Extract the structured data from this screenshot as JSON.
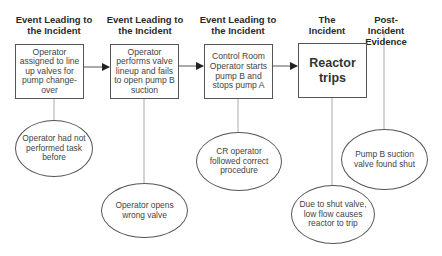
{
  "diagram": {
    "columns": [
      {
        "header": "Event Leading to the Incident",
        "event": "Operator assigned to line up valves for pump change-over",
        "factor": "Operator had not performed task before"
      },
      {
        "header": "Event Leading to the Incident",
        "event": "Operator performs valve lineup and fails to open pump B suction",
        "factor": "Operator opens wrong valve"
      },
      {
        "header": "Event Leading to the Incident",
        "event": "Control Room Operator starts pump B and stops pump A",
        "factor": "CR operator followed correct procedure"
      },
      {
        "header": "The Incident",
        "event": "Reactor trips",
        "factor": "Due to shut valve, low flow causes reactor to trip"
      },
      {
        "header": "Post-Incident Evidence",
        "event": null,
        "factor": "Pump B suction valve found shut"
      }
    ],
    "colors": {
      "line": "#555555",
      "connector": "#aaaaaa",
      "text": "#333333"
    }
  }
}
